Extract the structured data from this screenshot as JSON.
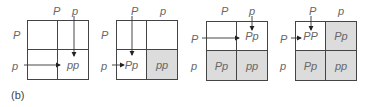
{
  "caption": "(b)",
  "colors": {
    "line": "#444444",
    "shaded": "#dcdcdc",
    "text": "#666666"
  },
  "squares": [
    {
      "col_labels": [
        "P",
        "p"
      ],
      "row_labels": [
        "P",
        "p"
      ],
      "cells": {
        "tl": "",
        "tr": "",
        "bl": "",
        "br": "pp"
      },
      "shaded": []
    },
    {
      "col_labels": [
        "P",
        "p"
      ],
      "row_labels": [
        "P",
        "p"
      ],
      "cells": {
        "tl": "",
        "tr": "",
        "bl": "Pp",
        "br": "pp"
      },
      "shaded": [
        "br"
      ]
    },
    {
      "col_labels": [
        "P",
        "p"
      ],
      "row_labels": [
        "P",
        "p"
      ],
      "cells": {
        "tl": "",
        "tr": "Pp",
        "bl": "Pp",
        "br": "pp"
      },
      "shaded": [
        "bl",
        "br"
      ]
    },
    {
      "col_labels": [
        "P",
        "p"
      ],
      "row_labels": [
        "P",
        "p"
      ],
      "cells": {
        "tl": "PP",
        "tr": "Pp",
        "bl": "Pp",
        "br": "pp"
      },
      "shaded": [
        "tr",
        "bl",
        "br"
      ]
    }
  ]
}
